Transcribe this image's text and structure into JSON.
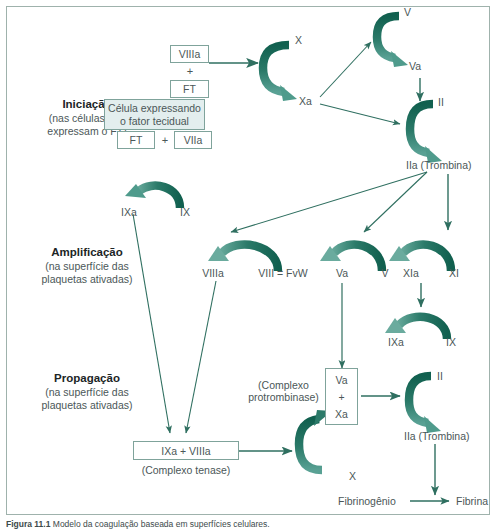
{
  "figure": {
    "caption_prefix": "Figura 11.1",
    "caption_text": "Modelo da coagulação baseada em superfícies celulares."
  },
  "colors": {
    "arrow_dark": "#176b5c",
    "arrow_light": "#4f9b8c",
    "line": "#2f6f60",
    "box_border": "#7fa39b",
    "box_shade": "#e3eeee",
    "text": "#4b5758",
    "frame": "#9fb2ac"
  },
  "stages": [
    {
      "id": "iniciacao",
      "title": "Iniciação",
      "sub_line1": "(nas células que",
      "sub_line2": "expressam o FT)"
    },
    {
      "id": "amplificacao",
      "title": "Amplificação",
      "sub_line1": "(na superfície das",
      "sub_line2": "plaquetas ativadas)"
    },
    {
      "id": "propagacao",
      "title": "Propagação",
      "sub_line1": "(na superfície das",
      "sub_line2": "plaquetas ativadas)"
    }
  ],
  "boxes": {
    "viiia_top": "VIIIa",
    "plus_top": "+",
    "ft_top": "FT",
    "cell_line1": "Célula expressando",
    "cell_line2": "o fator tecidual",
    "ft_bottom": "FT",
    "plus_bottom": "+",
    "viiia_bottom": "VIIa",
    "va_stack": "Va",
    "plus_stack": "+",
    "xa_stack": "Xa",
    "tenase_complex": "IXa  + VIIIa"
  },
  "factors": {
    "ix": "IX",
    "ixa": "IXa",
    "x_top": "X",
    "xa_top": "Xa",
    "v_top": "V",
    "va_top": "Va",
    "ii_top": "II",
    "iia_top": "IIa (Trombina)",
    "viii_fvw": "VIII = FvW",
    "viiia_amp": "VIIIa",
    "v_amp": "V",
    "va_amp": "Va",
    "xi_amp": "XI",
    "xia_amp": "XIa",
    "ix_amp": "IX",
    "ixa_amp": "IXa",
    "x_prop": "X",
    "ii_prop": "II",
    "iia_prop": "IIa (Trombina)",
    "fibrinogenio": "Fibrinogênio",
    "fibrina": "Fibrina"
  },
  "annotations": {
    "prothrombinase_line1": "(Complexo",
    "prothrombinase_line2": "protrombinase)",
    "tenase_label": "(Complexo tenase)"
  }
}
